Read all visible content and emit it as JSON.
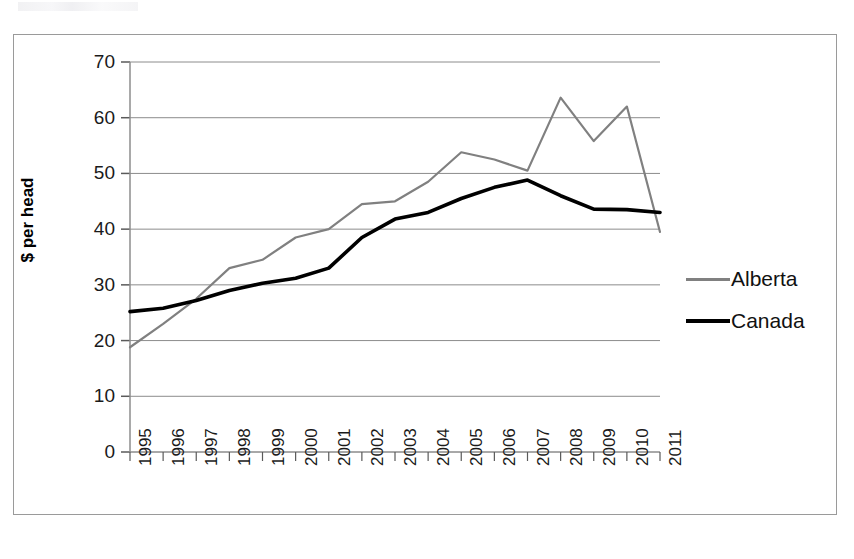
{
  "chart_data": {
    "type": "line",
    "title": "",
    "xlabel": "",
    "ylabel": "$ per head",
    "ylim": [
      0,
      70
    ],
    "ytick_step": 10,
    "yticks": [
      "70",
      "60",
      "50",
      "40",
      "30",
      "20",
      "10",
      "0"
    ],
    "grid": true,
    "legend_position": "right",
    "categories": [
      "1995",
      "1996",
      "1997",
      "1998",
      "1999",
      "2000",
      "2001",
      "2002",
      "2003",
      "2004",
      "2005",
      "2006",
      "2007",
      "2008",
      "2009",
      "2010",
      "2011"
    ],
    "series": [
      {
        "name": "Alberta",
        "color": "#808080",
        "values": [
          18.8,
          23.0,
          27.5,
          33.0,
          34.5,
          38.5,
          40.0,
          44.5,
          45.0,
          48.5,
          53.8,
          52.5,
          50.5,
          63.6,
          55.8,
          62.0,
          39.5
        ]
      },
      {
        "name": "Canada",
        "color": "#000000",
        "values": [
          25.2,
          25.8,
          27.2,
          29.0,
          30.3,
          31.2,
          33.0,
          38.5,
          41.8,
          43.0,
          45.5,
          47.5,
          48.8,
          46.0,
          43.6,
          43.5,
          43.0
        ]
      }
    ]
  },
  "legend": {
    "items": [
      {
        "label": "Alberta"
      },
      {
        "label": "Canada"
      }
    ]
  },
  "axes": {
    "y_title": "$ per head"
  }
}
